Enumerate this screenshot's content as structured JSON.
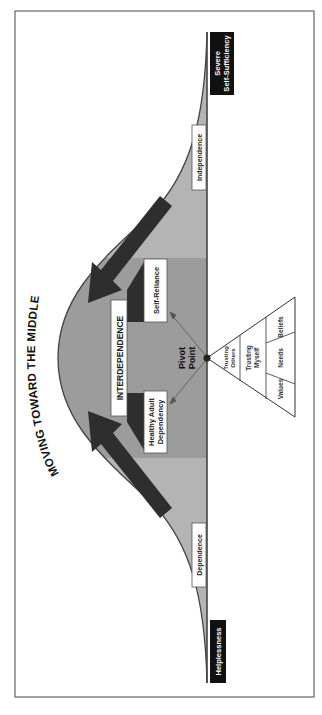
{
  "title": "MOVING TOWARD THE MIDDLE",
  "extremes": {
    "top": {
      "line1": "Severe",
      "line2": "Self-Sufficiency"
    },
    "bottom": "Helplessness"
  },
  "zones": {
    "independence": "Independence",
    "dependence": "Dependence",
    "interdependence": "INTERDEPENDENCE",
    "self_reliance": "Self-Reliance",
    "healthy_adult_dependency": {
      "line1": "Healthy Adult",
      "line2": "Dependency"
    }
  },
  "pivot": {
    "line1": "Pivot",
    "line2": "Point"
  },
  "pyramid": {
    "tier1": {
      "line1": "Trusting",
      "line2": "Others"
    },
    "tier2": {
      "line1": "Trusting",
      "line2": "Myself"
    },
    "tier3": [
      "Values",
      "Needs",
      "Beliefs"
    ]
  },
  "colors": {
    "curve_fill": "#b4b4b4",
    "middle_band": "#9c9c9c",
    "arrow": "#2e2e2e",
    "label_black": "#111111",
    "line": "#444444"
  }
}
